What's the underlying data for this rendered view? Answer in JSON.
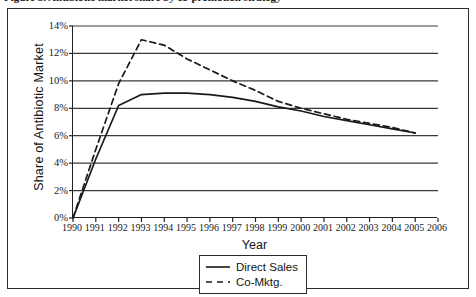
{
  "figure": {
    "caption_clipped": "Figure 3. Antibiotic market share by co-promotion strategy"
  },
  "chart_data": {
    "type": "line",
    "title": "",
    "xlabel": "Year",
    "ylabel": "Share of Antibiotic Market",
    "xlim": [
      1990,
      2006
    ],
    "ylim": [
      0,
      14
    ],
    "grid": true,
    "legend_position": "bottom-center",
    "x": [
      1990,
      1991,
      1992,
      1993,
      1994,
      1995,
      1996,
      1997,
      1998,
      1999,
      2000,
      2001,
      2002,
      2003,
      2004,
      2005
    ],
    "xtick_labels": [
      "1990",
      "1991",
      "1992",
      "1993",
      "1994",
      "1995",
      "1996",
      "1997",
      "1998",
      "1999",
      "2000",
      "2001",
      "2002",
      "2003",
      "2004",
      "2005",
      "2006"
    ],
    "ytick_labels": [
      "0%",
      "2%",
      "4%",
      "6%",
      "8%",
      "10%",
      "12%",
      "14%"
    ],
    "ytick_values": [
      0,
      2,
      4,
      6,
      8,
      10,
      12,
      14
    ],
    "series": [
      {
        "name": "Direct Sales",
        "style": "solid",
        "color": "#1a1a1a",
        "values": [
          0.0,
          4.3,
          8.2,
          9.0,
          9.1,
          9.1,
          9.0,
          8.8,
          8.5,
          8.1,
          7.8,
          7.4,
          7.1,
          6.8,
          6.5,
          6.2
        ]
      },
      {
        "name": "Co-Mktg.",
        "style": "dashed",
        "color": "#1a1a1a",
        "values": [
          0.0,
          5.0,
          9.8,
          13.0,
          12.6,
          11.6,
          10.8,
          10.0,
          9.3,
          8.5,
          8.0,
          7.6,
          7.2,
          6.9,
          6.6,
          6.2
        ]
      }
    ]
  }
}
